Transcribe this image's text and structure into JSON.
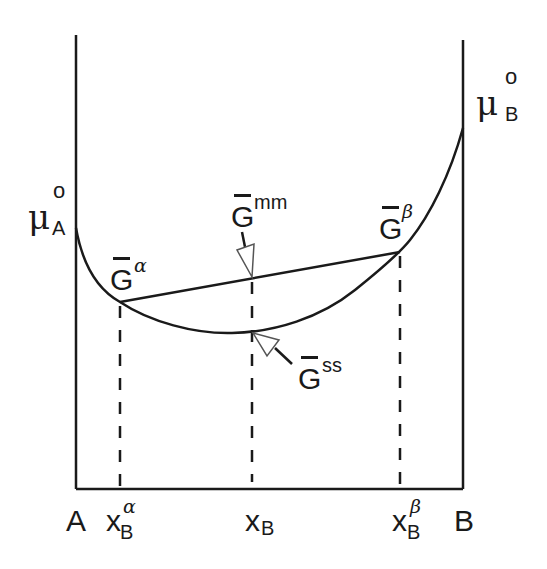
{
  "diagram": {
    "type": "free-energy-composition",
    "axis_left_label": "A",
    "axis_right_label": "B",
    "mu_A": {
      "symbol": "μ",
      "sup": "o",
      "sub": "A"
    },
    "mu_B": {
      "symbol": "μ",
      "sup": "o",
      "sub": "B"
    },
    "G_alpha": {
      "symbol": "G",
      "sup": "α"
    },
    "G_beta": {
      "symbol": "G",
      "sup": "β"
    },
    "G_mm": {
      "symbol": "G",
      "sup": "mm"
    },
    "G_ss": {
      "symbol": "G",
      "sup": "ss"
    },
    "x_alpha": {
      "symbol": "x",
      "sub": "B",
      "sup": "α"
    },
    "x_B": {
      "symbol": "x",
      "sub": "B"
    },
    "x_beta": {
      "symbol": "x",
      "sub": "B",
      "sup": "β"
    },
    "colors": {
      "line": "#1a1a1a",
      "background": "#ffffff"
    }
  }
}
